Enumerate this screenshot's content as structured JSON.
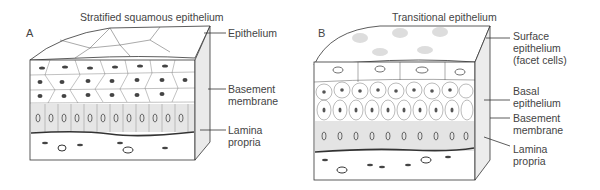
{
  "panels": [
    {
      "letter": "A",
      "title": "Stratified squamous epithelium",
      "labels": [
        {
          "text": "Epithelium"
        },
        {
          "text": "Basement\nmembrane"
        },
        {
          "text": "Lamina\npropria"
        }
      ]
    },
    {
      "letter": "B",
      "title": "Transitional epithelium",
      "labels": [
        {
          "text": "Surface\nepithelium\n(facet cells)"
        },
        {
          "text": "Basal\nepithelium"
        },
        {
          "text": "Basement\nmembrane"
        },
        {
          "text": "Lamina\npropria"
        }
      ]
    }
  ],
  "colors": {
    "ink": "#333333",
    "stipple": "#cfcfcf",
    "background": "#ffffff"
  }
}
